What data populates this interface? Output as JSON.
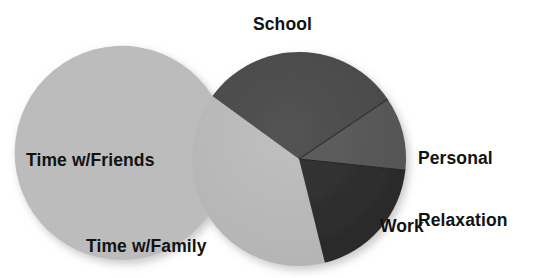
{
  "chart_data": {
    "type": "pie",
    "title": "",
    "categories": [
      "School",
      "Personal Relaxation",
      "Work",
      "Time w/Family",
      "Time w/Friends"
    ],
    "values": [
      30.5,
      11.0,
      19.5,
      20.0,
      19.0
    ],
    "unit": "percent",
    "legend": "none",
    "labels_position": "outside",
    "start_angle_deg": -54,
    "direction": "clockwise",
    "slices": [
      {
        "label": "School",
        "value": 30.5,
        "color": "#4a4a4a",
        "start_deg": -54,
        "end_deg": 56
      },
      {
        "label": "Personal Relaxation",
        "value": 11.0,
        "color": "#575757",
        "start_deg": 56,
        "end_deg": 96
      },
      {
        "label": "Work",
        "value": 19.5,
        "color": "#2b2b2b",
        "start_deg": 96,
        "end_deg": 166
      },
      {
        "label": "Time w/Family",
        "value": 20.0,
        "color": "#bcbcbc",
        "start_deg": 166,
        "end_deg": 238
      },
      {
        "label": "Time w/Friends",
        "value": 19.0,
        "color": "#bcbcbc",
        "start_deg": 238,
        "end_deg": 306
      }
    ]
  },
  "geometry": {
    "center_x": 299,
    "center_y": 159,
    "radius": 107
  },
  "labels": {
    "school": "School",
    "relaxation_line1": "Personal",
    "relaxation_line2": "Relaxation",
    "work": "Work",
    "family": "Time w/Family",
    "friends": "Time w/Friends"
  },
  "colors": {
    "background": "#ffffff",
    "text": "#121212",
    "school": "#4a4a4a",
    "relaxation": "#575757",
    "work": "#2b2b2b",
    "family": "#bcbcbc",
    "friends": "#bcbcbc",
    "divider": "#3a3a3a"
  }
}
